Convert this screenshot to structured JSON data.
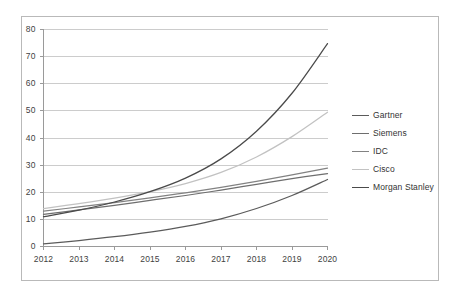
{
  "chart_data": {
    "type": "line",
    "title": "",
    "subtitle": "",
    "xlabel": "",
    "ylabel": "",
    "categories": [
      "2012",
      "2013",
      "2014",
      "2015",
      "2016",
      "2017",
      "2018",
      "2019",
      "2020"
    ],
    "x": [
      2012,
      2013,
      2014,
      2015,
      2016,
      2017,
      2018,
      2019,
      2020
    ],
    "xlim": [
      2012,
      2020
    ],
    "ylim": [
      0,
      80
    ],
    "ytick_labels": [
      "0",
      "10",
      "20",
      "30",
      "40",
      "50",
      "60",
      "70",
      "80"
    ],
    "ytick_values": [
      0,
      10,
      20,
      30,
      40,
      50,
      60,
      70,
      80
    ],
    "grid": "horizontal",
    "legend_position": "right",
    "series": [
      {
        "name": "Gartner",
        "color": "#5b5b5b",
        "values": [
          1.0,
          2.2,
          3.6,
          5.3,
          7.4,
          10.2,
          14.0,
          18.8,
          24.7
        ]
      },
      {
        "name": "Siemens",
        "color": "#6e6e6e",
        "values": [
          11.8,
          13.5,
          15.2,
          17.0,
          18.8,
          20.8,
          22.9,
          25.0,
          26.9
        ]
      },
      {
        "name": "IDC",
        "color": "#828282",
        "values": [
          13.0,
          14.6,
          16.2,
          17.9,
          19.8,
          21.8,
          24.0,
          26.4,
          28.9
        ]
      },
      {
        "name": "Cisco",
        "color": "#c2c2c2",
        "values": [
          14.0,
          15.8,
          17.8,
          20.2,
          23.2,
          27.3,
          33.0,
          40.5,
          49.5
        ]
      },
      {
        "name": "Morgan Stanley",
        "color": "#4a4a4a",
        "values": [
          11.0,
          13.4,
          16.4,
          20.2,
          25.2,
          32.3,
          42.5,
          56.5,
          74.8
        ]
      }
    ]
  },
  "legend": {
    "items": [
      {
        "label": "Gartner"
      },
      {
        "label": "Siemens"
      },
      {
        "label": "IDC"
      },
      {
        "label": "Cisco"
      },
      {
        "label": "Morgan Stanley"
      }
    ]
  },
  "axes": {
    "y_labels": [
      "80",
      "70",
      "60",
      "50",
      "40",
      "30",
      "20",
      "10",
      "0"
    ],
    "x_labels": [
      "2012",
      "2013",
      "2014",
      "2015",
      "2016",
      "2017",
      "2018",
      "2019",
      "2020"
    ]
  },
  "colors": {
    "frame": "#b9b9b9",
    "gridline": "#bfbfbf",
    "axis": "#9a9a9a",
    "text": "#3f3f3f",
    "background": "#ffffff"
  }
}
